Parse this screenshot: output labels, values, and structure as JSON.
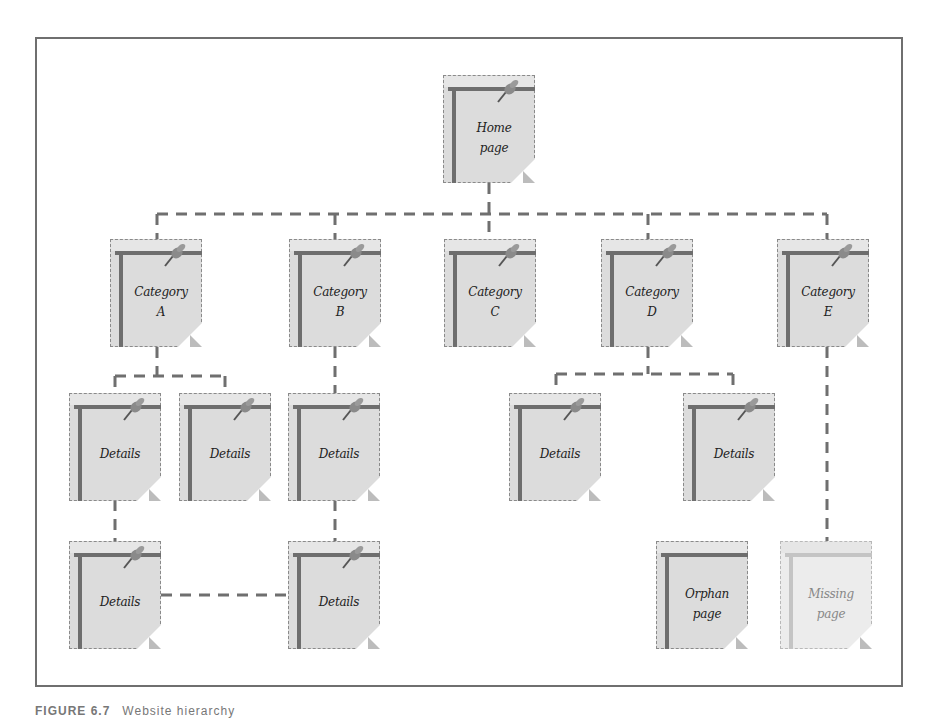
{
  "diagram": {
    "type": "site-hierarchy",
    "line_color": "#6f6f6f",
    "page_fill": "#dcdcdc",
    "missing_fill": "#ececec",
    "nodes": {
      "home": {
        "label_l1": "Home",
        "label_l2": "page"
      },
      "cat_a": {
        "label_l1": "Category",
        "label_l2": "A"
      },
      "cat_b": {
        "label_l1": "Category",
        "label_l2": "B"
      },
      "cat_c": {
        "label_l1": "Category",
        "label_l2": "C"
      },
      "cat_d": {
        "label_l1": "Category",
        "label_l2": "D"
      },
      "cat_e": {
        "label_l1": "Category",
        "label_l2": "E"
      },
      "a_det1": {
        "label_l1": "Details"
      },
      "a_det2": {
        "label_l1": "Details"
      },
      "b_det1": {
        "label_l1": "Details"
      },
      "d_det1": {
        "label_l1": "Details"
      },
      "d_det2": {
        "label_l1": "Details"
      },
      "a_det1_sub": {
        "label_l1": "Details"
      },
      "b_det1_sub": {
        "label_l1": "Details"
      },
      "orphan": {
        "label_l1": "Orphan",
        "label_l2": "page"
      },
      "missing": {
        "label_l1": "Missing",
        "label_l2": "page"
      }
    },
    "edges": [
      [
        "home",
        "cat_a"
      ],
      [
        "home",
        "cat_b"
      ],
      [
        "home",
        "cat_c"
      ],
      [
        "home",
        "cat_d"
      ],
      [
        "home",
        "cat_e"
      ],
      [
        "cat_a",
        "a_det1"
      ],
      [
        "cat_a",
        "a_det2"
      ],
      [
        "cat_b",
        "b_det1"
      ],
      [
        "cat_d",
        "d_det1"
      ],
      [
        "cat_d",
        "d_det2"
      ],
      [
        "a_det1",
        "a_det1_sub"
      ],
      [
        "b_det1",
        "b_det1_sub"
      ],
      [
        "a_det1_sub",
        "b_det1_sub"
      ],
      [
        "cat_e",
        "missing"
      ]
    ]
  },
  "caption": {
    "figure_number": "FIGURE 6.7",
    "text": "Website hierarchy"
  }
}
